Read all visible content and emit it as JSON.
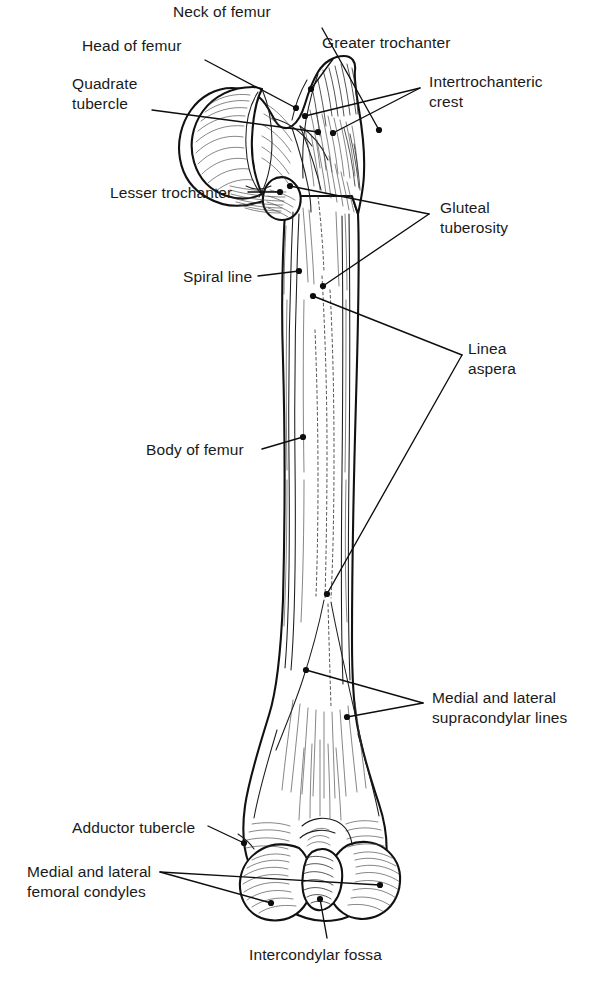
{
  "figure": {
    "view": "anterior",
    "style": "line drawing, black ink on white",
    "colors": {
      "background": "#ffffff",
      "ink": "#111111",
      "label_text": "#1a1a1a",
      "leader_line": "#0d0d0d"
    }
  },
  "labels": [
    {
      "id": "neck-of-femur",
      "text": "Neck of femur",
      "text_x": 173,
      "text_y": 2,
      "align": "left",
      "lines": 1,
      "leaders": [
        [
          [
            322,
            28
          ],
          [
            379,
            130
          ]
        ]
      ],
      "points": [
        [
          379,
          130
        ]
      ]
    },
    {
      "id": "head-of-femur",
      "text": "Head of femur",
      "text_x": 82,
      "text_y": 36,
      "align": "left",
      "lines": 1,
      "leaders": [
        [
          [
            205,
            60
          ],
          [
            296,
            108
          ]
        ]
      ],
      "points": [
        [
          296,
          108
        ]
      ]
    },
    {
      "id": "quadrate-tubercle",
      "text": "Quadrate\ntubercle",
      "text_x": 72,
      "text_y": 74,
      "align": "left",
      "lines": 2,
      "leaders": [
        [
          [
            152,
            110
          ],
          [
            318,
            132
          ]
        ]
      ],
      "points": [
        [
          318,
          132
        ]
      ]
    },
    {
      "id": "greater-trochanter",
      "text": "Greater trochanter",
      "text_x": 322,
      "text_y": 33,
      "align": "left",
      "lines": 1,
      "leaders": [
        [
          [
            333,
            59
          ],
          [
            311,
            89
          ]
        ]
      ],
      "points": [
        [
          311,
          89
        ]
      ]
    },
    {
      "id": "intertrochanteric-crest",
      "text": "Intertrochanteric\ncrest",
      "text_x": 429,
      "text_y": 72,
      "align": "left",
      "lines": 2,
      "leaders": [
        [
          [
            420,
            88
          ],
          [
            305,
            116
          ]
        ],
        [
          [
            420,
            88
          ],
          [
            333,
            133
          ]
        ]
      ],
      "points": [
        [
          305,
          116
        ],
        [
          333,
          133
        ]
      ]
    },
    {
      "id": "lesser-trochanter",
      "text": "Lesser trochanter",
      "text_x": 110,
      "text_y": 183,
      "align": "left",
      "lines": 1,
      "leaders": [
        [
          [
            248,
            192
          ],
          [
            280,
            192
          ]
        ]
      ],
      "points": [
        [
          280,
          192
        ]
      ]
    },
    {
      "id": "gluteal-tuberosity",
      "text": "Gluteal\ntuberosity",
      "text_x": 440,
      "text_y": 198,
      "align": "left",
      "lines": 2,
      "leaders": [
        [
          [
            429,
            214
          ],
          [
            290,
            186
          ]
        ],
        [
          [
            429,
            214
          ],
          [
            323,
            286
          ]
        ]
      ],
      "points": [
        [
          290,
          186
        ],
        [
          323,
          286
        ]
      ]
    },
    {
      "id": "spiral-line",
      "text": "Spiral line",
      "text_x": 183,
      "text_y": 267,
      "align": "left",
      "lines": 1,
      "leaders": [
        [
          [
            258,
            276
          ],
          [
            299,
            271
          ]
        ]
      ],
      "points": [
        [
          299,
          271
        ]
      ]
    },
    {
      "id": "linea-aspera",
      "text": "Linea\naspera",
      "text_x": 468,
      "text_y": 339,
      "align": "left",
      "lines": 2,
      "leaders": [
        [
          [
            462,
            355
          ],
          [
            313,
            296
          ]
        ],
        [
          [
            462,
            355
          ],
          [
            327,
            594
          ]
        ]
      ],
      "points": [
        [
          313,
          296
        ],
        [
          327,
          594
        ]
      ]
    },
    {
      "id": "body-of-femur",
      "text": "Body of femur",
      "text_x": 146,
      "text_y": 440,
      "align": "left",
      "lines": 1,
      "leaders": [
        [
          [
            262,
            449
          ],
          [
            303,
            437
          ]
        ]
      ],
      "points": [
        [
          303,
          437
        ]
      ]
    },
    {
      "id": "medial-lateral-supracondylar-lines",
      "text": "Medial and lateral\nsupracondylar lines",
      "text_x": 432,
      "text_y": 688,
      "align": "left",
      "lines": 2,
      "leaders": [
        [
          [
            423,
            703
          ],
          [
            306,
            670
          ]
        ],
        [
          [
            423,
            703
          ],
          [
            347,
            717
          ]
        ]
      ],
      "points": [
        [
          306,
          670
        ],
        [
          347,
          717
        ]
      ]
    },
    {
      "id": "adductor-tubercle",
      "text": "Adductor tubercle",
      "text_x": 72,
      "text_y": 818,
      "align": "left",
      "lines": 1,
      "leaders": [
        [
          [
            208,
            826
          ],
          [
            244,
            843
          ]
        ]
      ],
      "points": [
        [
          244,
          843
        ]
      ]
    },
    {
      "id": "medial-lateral-femoral-condyles",
      "text": "Medial and lateral\nfemoral condyles",
      "text_x": 27,
      "text_y": 862,
      "align": "left",
      "lines": 2,
      "leaders": [
        [
          [
            160,
            872
          ],
          [
            380,
            885
          ]
        ],
        [
          [
            160,
            872
          ],
          [
            271,
            903
          ]
        ]
      ],
      "points": [
        [
          380,
          885
        ],
        [
          271,
          903
        ]
      ]
    },
    {
      "id": "intercondylar-fossa",
      "text": "Intercondylar fossa",
      "text_x": 249,
      "text_y": 945,
      "align": "left",
      "lines": 1,
      "leaders": [
        [
          [
            327,
            938
          ],
          [
            320,
            899
          ]
        ]
      ],
      "points": [
        [
          320,
          899
        ]
      ]
    }
  ],
  "anatomy_parts": [
    "head of femur",
    "neck of femur",
    "quadrate tubercle",
    "greater trochanter",
    "intertrochanteric crest",
    "lesser trochanter",
    "gluteal tuberosity",
    "spiral line",
    "linea aspera",
    "body of femur",
    "medial and lateral supracondylar lines",
    "adductor tubercle",
    "medial and lateral femoral condyles",
    "intercondylar fossa"
  ]
}
